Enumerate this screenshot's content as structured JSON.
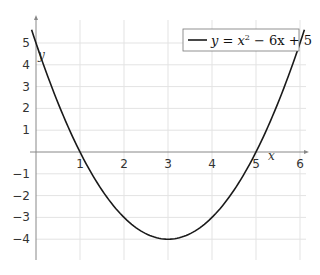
{
  "chart_data": {
    "type": "line",
    "title": "",
    "xlabel": "x",
    "ylabel": "y",
    "xlim": [
      0,
      6
    ],
    "ylim": [
      -5,
      6
    ],
    "grid": true,
    "legend_position": "upper right",
    "x_ticks": [
      "1",
      "2",
      "3",
      "4",
      "5",
      "6"
    ],
    "y_ticks": [
      "5",
      "4",
      "3",
      "2",
      "1",
      "-1",
      "-2",
      "-3",
      "-4"
    ],
    "y_tick_values": [
      5,
      4,
      3,
      2,
      1,
      -1,
      -2,
      -3,
      -4
    ],
    "x_tick_values": [
      1,
      2,
      3,
      4,
      5,
      6
    ],
    "series": [
      {
        "name": "y = x² − 6x + 5",
        "color": "#1a1a1a",
        "x": [
          -0.1,
          0,
          0.5,
          1,
          1.5,
          2,
          2.5,
          3,
          3.5,
          4,
          4.5,
          5,
          5.5,
          6,
          6.1
        ],
        "values": [
          5.61,
          5,
          2.25,
          0,
          -1.75,
          -3,
          -3.75,
          -4,
          -3.75,
          -3,
          -1.75,
          0,
          2.25,
          5,
          5.61
        ]
      }
    ]
  },
  "legend": {
    "label_prefix": "y = x",
    "label_sup": "2",
    "label_suffix": " − 6x + 5"
  },
  "axes": {
    "x_label": "x",
    "y_label": "y"
  }
}
